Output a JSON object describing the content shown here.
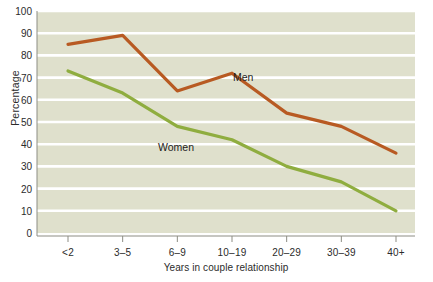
{
  "chart_data": {
    "type": "line",
    "title": "",
    "subtitle": "",
    "xlabel": "Years in couple relationship",
    "ylabel": "Percentage",
    "categories": [
      "<2",
      "3–5",
      "6–9",
      "10–19",
      "20–29",
      "30–39",
      "40+"
    ],
    "series": [
      {
        "name": "Men",
        "color": "#b85a22",
        "values": [
          85,
          89,
          64,
          72,
          54,
          48,
          36
        ]
      },
      {
        "name": "Women",
        "color": "#8fad3f",
        "values": [
          73,
          63,
          48,
          42,
          30,
          23,
          10
        ]
      }
    ],
    "ylim": [
      0,
      100
    ],
    "ytick_step": 10,
    "yticks": [
      100,
      90,
      80,
      70,
      60,
      50,
      40,
      30,
      20,
      10,
      0
    ],
    "grid": true,
    "grid_axis": "y",
    "grid_color": "#ffffff",
    "legend": "inline-annotations",
    "legend_position": "on-plot",
    "plot_background": "#dfe0cc",
    "annotations": [
      {
        "text": "Men",
        "series": "Men",
        "x": "10–19"
      },
      {
        "text": "Women",
        "series": "Women",
        "x": "6–9"
      }
    ]
  },
  "axis": {
    "y_title": "Percentage",
    "x_title": "Years in couple relationship"
  }
}
